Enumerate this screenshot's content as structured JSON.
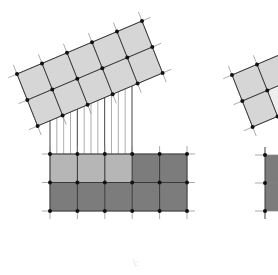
{
  "figure": {
    "colors": {
      "background": "#ffffff",
      "rotated_fill": "#d6d6d6",
      "light_cell": "#b6b6b6",
      "dark_cell": "#7c7c7c",
      "grid_line": "#3a3a3a",
      "tick_line": "#888888",
      "projection_line": "#8a8a8a",
      "projection_line_strong": "#444444",
      "vertex": "#111111"
    },
    "left_panel": {
      "rotated_grid": {
        "origin": [
          17,
          74
        ],
        "u": [
          25,
          -10.6
        ],
        "v": [
          10.3,
          26
        ],
        "cols": 5,
        "rows": 2
      },
      "target_grid": {
        "origin": [
          50,
          154
        ],
        "cell_w": 27.4,
        "cell_h": 28.5,
        "cols": 5,
        "rows": 2,
        "light_cells": [
          [
            0,
            0
          ],
          [
            0,
            1
          ],
          [
            0,
            2
          ]
        ]
      },
      "projection_lines": {
        "x_start": 50,
        "x_end": 132,
        "count": 13,
        "y_end": 154
      }
    },
    "right_panel": {
      "rotated_grid": {
        "origin": [
          232,
          75
        ],
        "u": [
          25,
          -10.6
        ],
        "v": [
          10.3,
          26
        ],
        "cols": 2,
        "rows": 2,
        "light_cells": [
          [
            1,
            1
          ]
        ]
      },
      "target_grid": {
        "x": 265,
        "ys": [
          155,
          183,
          211
        ],
        "fill_to": 278
      }
    },
    "caption": "\\:"
  }
}
